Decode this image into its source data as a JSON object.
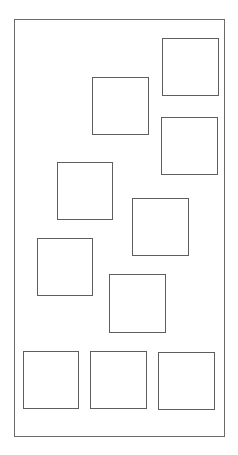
{
  "canvas": {
    "width": 238,
    "height": 455,
    "background": "#ffffff",
    "stroke": "#5e5e5e"
  },
  "frame": {
    "x": 14,
    "y": 19,
    "w": 211,
    "h": 418
  },
  "boxes": [
    {
      "id": "box-1",
      "x": 162,
      "y": 38,
      "w": 57,
      "h": 58
    },
    {
      "id": "box-2",
      "x": 92,
      "y": 77,
      "w": 57,
      "h": 58
    },
    {
      "id": "box-3",
      "x": 161,
      "y": 117,
      "w": 57,
      "h": 58
    },
    {
      "id": "box-4",
      "x": 57,
      "y": 162,
      "w": 56,
      "h": 58
    },
    {
      "id": "box-5",
      "x": 132,
      "y": 198,
      "w": 57,
      "h": 58
    },
    {
      "id": "box-6",
      "x": 37,
      "y": 238,
      "w": 56,
      "h": 58
    },
    {
      "id": "box-7",
      "x": 109,
      "y": 274,
      "w": 57,
      "h": 59
    },
    {
      "id": "box-8",
      "x": 23,
      "y": 351,
      "w": 56,
      "h": 58
    },
    {
      "id": "box-9",
      "x": 90,
      "y": 351,
      "w": 57,
      "h": 58
    },
    {
      "id": "box-10",
      "x": 158,
      "y": 352,
      "w": 57,
      "h": 58
    }
  ]
}
